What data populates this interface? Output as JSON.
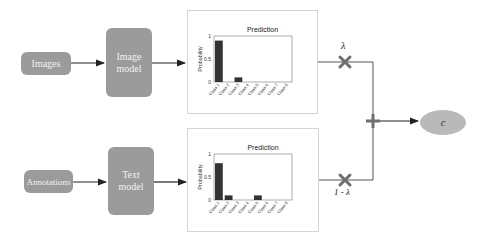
{
  "inputs": {
    "top": "Images",
    "bottom": "Annotations"
  },
  "models": {
    "top_line1": "Image",
    "top_line2": "model",
    "bottom_line1": "Text",
    "bottom_line2": "model"
  },
  "weights": {
    "top": "λ",
    "bottom": "1 - λ"
  },
  "output": "c",
  "colors": {
    "box_fill": "#9b9b9b",
    "bar_fill": "#333333",
    "ellipse_fill": "#b9b9b9",
    "operator": "#6e6e6e"
  },
  "chart_data": [
    {
      "type": "bar",
      "title": "Prediction",
      "xlabel": "",
      "ylabel": "Probability",
      "categories": [
        "Class 1",
        "Class 2",
        "Class 3",
        "Class 4",
        "Class 5",
        "Class 6",
        "Class 7",
        "Class 8"
      ],
      "values": [
        0.9,
        0.0,
        0.1,
        0.0,
        0.0,
        0.0,
        0.0,
        0.0
      ],
      "yticks": [
        "0",
        "0.5",
        "1"
      ],
      "ylim": [
        0,
        1
      ],
      "grid": false
    },
    {
      "type": "bar",
      "title": "Prediction",
      "xlabel": "",
      "ylabel": "Probability",
      "categories": [
        "Class 1",
        "Class 2",
        "Class 3",
        "Class 4",
        "Class 5",
        "Class 6",
        "Class 7",
        "Class 8"
      ],
      "values": [
        0.8,
        0.1,
        0.0,
        0.0,
        0.1,
        0.0,
        0.0,
        0.0
      ],
      "yticks": [
        "0",
        "0.5",
        "1"
      ],
      "ylim": [
        0,
        1
      ],
      "grid": false
    }
  ]
}
